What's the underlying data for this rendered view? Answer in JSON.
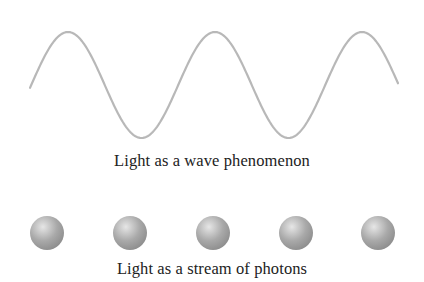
{
  "wave": {
    "caption": "Light as a wave phenomenon",
    "color": "#b8b8b8",
    "stroke_width": 2.2,
    "x_start": 30,
    "x_end": 398,
    "midline_y": 85,
    "amplitude": 53,
    "period": 147,
    "first_peak_x": 68
  },
  "photons": {
    "caption": "Light as a stream of photons",
    "count": 5,
    "centers_x": [
      47,
      130,
      213,
      296,
      378
    ],
    "center_y": 233,
    "radius": 17,
    "highlight_color": "#e6e6e6",
    "base_color": "#a9a9a9",
    "shadow_color": "#8a8a8a"
  }
}
